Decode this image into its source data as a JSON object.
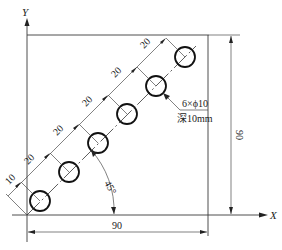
{
  "diagram": {
    "axes": {
      "x_label": "X",
      "y_label": "Y"
    },
    "plate": {
      "width_label": "90",
      "height_label": "90"
    },
    "hole_spec": {
      "count_diameter": "6×ϕ10",
      "depth": "深10mm"
    },
    "angle_label": "45°",
    "pitch_labels": [
      "10",
      "20",
      "20",
      "20",
      "20",
      "20"
    ],
    "colors": {
      "line": "#3a3a3a",
      "hole": "#111111",
      "background": "#ffffff"
    }
  }
}
